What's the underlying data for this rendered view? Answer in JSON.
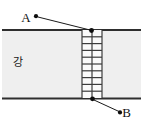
{
  "diagram": {
    "river_label": "강",
    "points": {
      "a": "A",
      "b": "B"
    },
    "bridge": {
      "rows": 10,
      "cols": 2
    },
    "colors": {
      "background": "#ffffff",
      "river_fill": "#efefef",
      "bank_line": "#2e2e2e",
      "bridge_fill": "#fafafa",
      "bridge_line": "#3c3c3c",
      "marker": "#0d0d0d",
      "pointer_line": "#1a1a1a",
      "label_text": "#111111"
    }
  }
}
